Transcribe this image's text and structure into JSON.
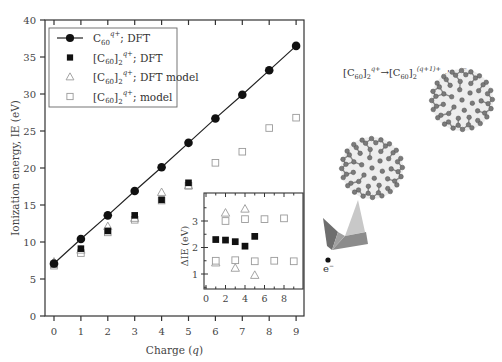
{
  "chart_data": [
    {
      "type": "scatter",
      "title": "",
      "xlabel": "Charge (q)",
      "ylabel": "Ionization energy, IE (eV)",
      "xlim": [
        -0.3,
        9.3
      ],
      "ylim": [
        0,
        40
      ],
      "xticks": [
        0,
        1,
        2,
        3,
        4,
        5,
        6,
        7,
        8,
        9
      ],
      "yticks": [
        0,
        5,
        10,
        15,
        20,
        25,
        30,
        35,
        40
      ],
      "grid": false,
      "legend_position": "upper left",
      "series": [
        {
          "name": "C60^q+; DFT",
          "marker": "filled-circle",
          "line": true,
          "x": [
            0,
            1,
            2,
            3,
            4,
            5,
            6,
            7,
            8,
            9
          ],
          "values": [
            7.1,
            10.4,
            13.6,
            16.9,
            20.1,
            23.4,
            26.7,
            29.9,
            33.2,
            36.5
          ]
        },
        {
          "name": "[C60]2^q+; DFT",
          "marker": "filled-square",
          "line": false,
          "x": [
            0,
            1,
            2,
            3,
            4,
            5
          ],
          "values": [
            7.0,
            9.1,
            11.5,
            13.6,
            15.7,
            18.0
          ]
        },
        {
          "name": "[C60]2^q+; DFT model",
          "marker": "open-triangle",
          "line": false,
          "x": [
            0,
            1,
            2,
            3,
            4,
            5
          ],
          "values": [
            7.3,
            8.9,
            12.1,
            13.2,
            16.7,
            17.6
          ]
        },
        {
          "name": "[C60]2^q+; model",
          "marker": "open-square",
          "line": false,
          "x": [
            0,
            1,
            2,
            3,
            4,
            5,
            6,
            7,
            8,
            9
          ],
          "values": [
            6.8,
            8.5,
            11.3,
            13.0,
            15.6,
            17.6,
            20.7,
            22.2,
            25.4,
            26.8
          ]
        }
      ]
    },
    {
      "type": "scatter",
      "title": "inset",
      "xlabel": "",
      "ylabel": "ΔIE (eV)",
      "xlim": [
        0,
        9.5
      ],
      "ylim": [
        0.4,
        3.8
      ],
      "xticks": [
        0,
        2,
        4,
        6,
        8
      ],
      "yticks": [
        1,
        2,
        3
      ],
      "series": [
        {
          "name": "[C60]2^q+; DFT",
          "marker": "filled-square",
          "x": [
            1,
            2,
            3,
            4,
            5
          ],
          "values": [
            2.3,
            2.28,
            2.22,
            2.05,
            2.42
          ]
        },
        {
          "name": "[C60]2^q+; DFT model",
          "marker": "open-triangle",
          "x": [
            1,
            2,
            3,
            4,
            5
          ],
          "values": [
            1.42,
            3.3,
            1.22,
            3.45,
            0.95
          ]
        },
        {
          "name": "[C60]2^q+; model",
          "marker": "open-square",
          "x": [
            1,
            2,
            3,
            4,
            5,
            6,
            7,
            8,
            9
          ],
          "values": [
            1.5,
            3.0,
            1.52,
            3.07,
            1.48,
            3.07,
            1.5,
            3.1,
            1.48
          ]
        }
      ]
    }
  ],
  "labels": {
    "xlabel_prefix": "Charge (",
    "xlabel_var": "q",
    "xlabel_suffix": ")",
    "ylabel": "Ionization energy, IE (eV)",
    "inset_ylabel": "ΔIE (eV)"
  },
  "legend": [
    {
      "base": "C",
      "sub": "60",
      "sup": "q+",
      "rest": "; DFT",
      "bracket": false
    },
    {
      "base": "[C",
      "sub": "60",
      "sub2": "2",
      "sup": "q+",
      "rest": "; DFT",
      "bracket": true
    },
    {
      "base": "[C",
      "sub": "60",
      "sub2": "2",
      "sup": "q+",
      "rest": "; DFT model",
      "bracket": true
    },
    {
      "base": "[C",
      "sub": "60",
      "sub2": "2",
      "sup": "q+",
      "rest": "; model",
      "bracket": true
    }
  ],
  "illustration": {
    "equation_left": "[C",
    "equation_sub": "60",
    "equation_sub2": "2",
    "equation_sup_left": "q+",
    "arrow": "→",
    "equation_sup_right": "(q+1)+",
    "equation_tail": "+ e",
    "electron_sup": "−",
    "electron_label": "e",
    "colors": {
      "fullerene": "#7a7a7a",
      "arrow": "#8c8c8c"
    }
  }
}
